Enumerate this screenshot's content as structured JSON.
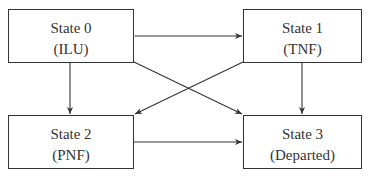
{
  "diagram": {
    "type": "state-transition",
    "states": [
      {
        "id": "s0",
        "name": "State 0",
        "abbr": "(ILU)"
      },
      {
        "id": "s1",
        "name": "State 1",
        "abbr": "(TNF)"
      },
      {
        "id": "s2",
        "name": "State 2",
        "abbr": "(PNF)"
      },
      {
        "id": "s3",
        "name": "State 3",
        "abbr": "(Departed)"
      }
    ],
    "transitions": [
      {
        "from": "State 0",
        "to": "State 1",
        "bidirectional": true
      },
      {
        "from": "State 0",
        "to": "State 2"
      },
      {
        "from": "State 0",
        "to": "State 3"
      },
      {
        "from": "State 1",
        "to": "State 2"
      },
      {
        "from": "State 1",
        "to": "State 3"
      },
      {
        "from": "State 2",
        "to": "State 3"
      }
    ],
    "colors": {
      "line": "#333333",
      "background": "#ffffff"
    }
  }
}
